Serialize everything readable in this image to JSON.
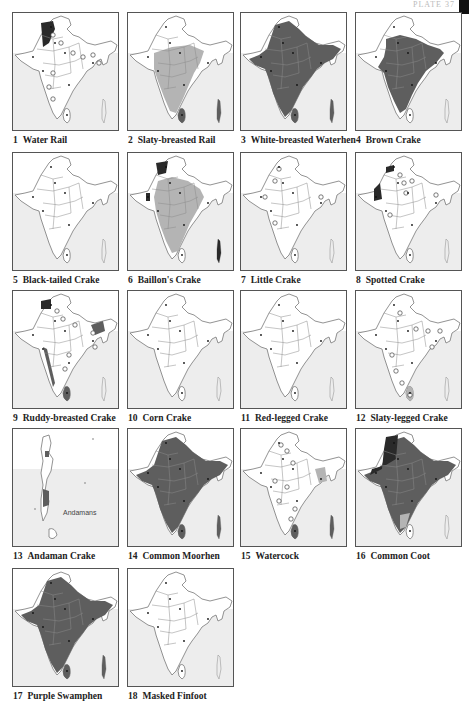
{
  "plate": {
    "label": "PLATE 37"
  },
  "colors": {
    "heavy": "#5e5e5e",
    "light": "#b4b4b4",
    "dark": "#2a2a2a",
    "sea": "#ededed",
    "land": "#ffffff",
    "border": "#8a8a8a"
  },
  "maps": [
    {
      "num": "1",
      "name": "Water Rail",
      "range": "nw-patch"
    },
    {
      "num": "2",
      "name": "Slaty-breasted Rail",
      "range": "light-peninsula"
    },
    {
      "num": "3",
      "name": "White-breasted Waterhen",
      "range": "heavy-all"
    },
    {
      "num": "4",
      "name": "Brown Crake",
      "range": "heavy-central"
    },
    {
      "num": "5",
      "name": "Black-tailed Crake",
      "range": "none"
    },
    {
      "num": "6",
      "name": "Baillon's Crake",
      "range": "light-central-nw-dark"
    },
    {
      "num": "7",
      "name": "Little Crake",
      "range": "points"
    },
    {
      "num": "8",
      "name": "Spotted Crake",
      "range": "nw-dark-points"
    },
    {
      "num": "9",
      "name": "Ruddy-breasted Crake",
      "range": "west-coast-ne"
    },
    {
      "num": "10",
      "name": "Corn Crake",
      "range": "none"
    },
    {
      "num": "11",
      "name": "Red-legged Crake",
      "range": "none"
    },
    {
      "num": "12",
      "name": "Slaty-legged Crake",
      "range": "srilanka-light"
    },
    {
      "num": "13",
      "name": "Andaman Crake",
      "range": "andamans",
      "inset_label": "Andamans"
    },
    {
      "num": "14",
      "name": "Common Moorhen",
      "range": "heavy-all"
    },
    {
      "num": "15",
      "name": "Watercock",
      "range": "points-light-ne"
    },
    {
      "num": "16",
      "name": "Common Coot",
      "range": "heavy-all-dark-nw"
    },
    {
      "num": "17",
      "name": "Purple Swamphen",
      "range": "heavy-all"
    },
    {
      "num": "18",
      "name": "Masked Finfoot",
      "range": "none"
    }
  ]
}
